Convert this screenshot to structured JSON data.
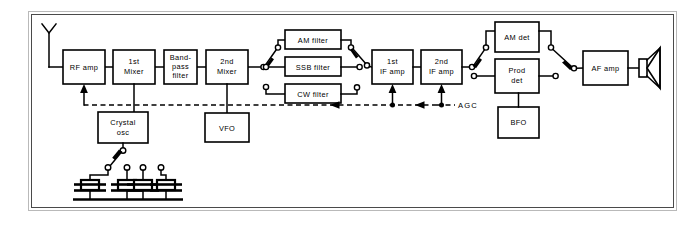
{
  "diagram": {
    "blocks": {
      "rf_amp": "RF amp",
      "mixer1_line1": "1st",
      "mixer1_line2": "Mixer",
      "bandpass_line1": "Band-",
      "bandpass_line2": "pass",
      "bandpass_line3": "filter",
      "mixer2_line1": "2nd",
      "mixer2_line2": "Mixer",
      "am_filter": "AM filter",
      "ssb_filter": "SSB filter",
      "cw_filter": "CW filter",
      "if_amp1_line1": "1st",
      "if_amp1_line2": "IF amp",
      "if_amp2_line1": "2nd",
      "if_amp2_line2": "IF amp",
      "am_det": "AM det",
      "prod_det_line1": "Prod",
      "prod_det_line2": "det",
      "bfo": "BFO",
      "af_amp": "AF amp",
      "crystal_osc_line1": "Crystal",
      "crystal_osc_line2": "osc",
      "vfo": "VFO"
    },
    "annotations": {
      "agc": "AGC"
    },
    "symbols": {
      "antenna": "antenna-icon",
      "speaker": "loudspeaker-icon",
      "crystal_count": 4,
      "ground": "ground-rail"
    },
    "colors": {
      "line": "#000000",
      "fill": "#ffffff",
      "frame": "#4a4a4a"
    }
  }
}
